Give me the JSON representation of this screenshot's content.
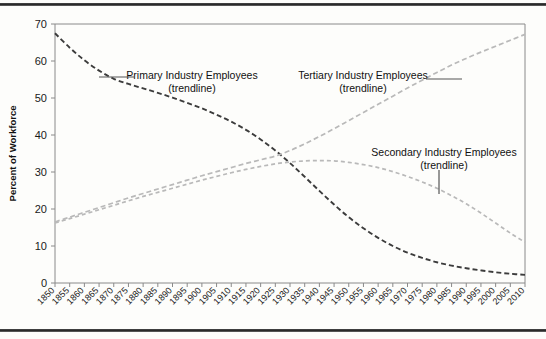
{
  "figure": {
    "background_color": "#fdfdfb",
    "rule_color": "#3a3a3a",
    "frame_color": "#8a8a8a"
  },
  "chart_data": {
    "type": "line",
    "title": "",
    "xlabel": "",
    "ylabel": "Percent of Workforce",
    "xlim": [
      1850,
      2010
    ],
    "ylim": [
      0,
      70
    ],
    "ytick_step": 10,
    "xtick_step": 5,
    "grid": false,
    "legend_position": "inline-annotations",
    "yticks": [
      0,
      10,
      20,
      30,
      40,
      50,
      60,
      70
    ],
    "categories": [
      "1850",
      "1855",
      "1860",
      "1865",
      "1870",
      "1875",
      "1880",
      "1885",
      "1890",
      "1895",
      "1900",
      "1905",
      "1910",
      "1915",
      "1920",
      "1925",
      "1930",
      "1935",
      "1940",
      "1945",
      "1950",
      "1955",
      "1960",
      "1965",
      "1970",
      "1975",
      "1980",
      "1985",
      "1990",
      "1995",
      "2000",
      "2005",
      "2010"
    ],
    "series": [
      {
        "name": "Primary Industry Employees (trendline)",
        "color": "#3c3c3c",
        "dash": "5,3",
        "width": 1.9,
        "values": [
          67.5,
          63.6,
          60.2,
          57.4,
          55.2,
          53.8,
          52.6,
          51.4,
          50.1,
          48.7,
          47.2,
          45.5,
          43.6,
          41.4,
          38.8,
          35.8,
          32.4,
          28.7,
          24.9,
          21.2,
          17.8,
          14.8,
          12.2,
          10.0,
          8.2,
          6.8,
          5.6,
          4.7,
          4.0,
          3.4,
          2.9,
          2.5,
          2.2
        ]
      },
      {
        "name": "Tertiary Industry Employees (trendline)",
        "color": "#b9b9b9",
        "dash": "5,3",
        "width": 1.7,
        "values": [
          16.5,
          17.8,
          19.1,
          20.4,
          21.7,
          23.0,
          24.2,
          25.4,
          26.6,
          27.8,
          29.0,
          30.1,
          31.2,
          32.3,
          33.3,
          34.3,
          35.8,
          37.6,
          39.6,
          41.7,
          43.9,
          46.1,
          48.3,
          50.5,
          52.7,
          54.8,
          56.9,
          58.9,
          60.7,
          62.4,
          64.0,
          65.6,
          67.2
        ]
      },
      {
        "name": "Secondary Industry Employees (trendline)",
        "color": "#b9b9b9",
        "dash": "4,3",
        "width": 1.7,
        "values": [
          16.2,
          17.4,
          18.6,
          19.8,
          21.0,
          22.2,
          23.4,
          24.5,
          25.6,
          26.7,
          27.8,
          28.8,
          29.8,
          30.7,
          31.5,
          32.2,
          32.7,
          33.0,
          33.1,
          33.0,
          32.6,
          32.0,
          31.2,
          30.1,
          28.8,
          27.3,
          25.6,
          23.6,
          21.4,
          18.9,
          16.2,
          13.5,
          11.0
        ]
      }
    ],
    "annotations": [
      {
        "id": "primary-annotation",
        "line1": "Primary Industry Employees",
        "line2": "(trendline)",
        "text_x": 192,
        "text_y": 79,
        "leader": "M 99,77 L 135,77"
      },
      {
        "id": "tertiary-annotation",
        "line1": "Tertiary Industry Employees",
        "line2": "(trendline)",
        "text_x": 363,
        "text_y": 79,
        "leader": "M 426,79 L 462,79"
      },
      {
        "id": "secondary-annotation",
        "line1": "Secondary Industry Employees",
        "line2": "(trendline)",
        "text_x": 444,
        "text_y": 156,
        "leader": "M 439,170 L 439,194"
      }
    ]
  }
}
